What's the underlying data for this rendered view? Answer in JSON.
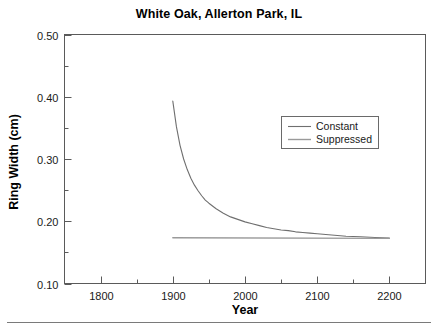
{
  "chart_data": {
    "type": "line",
    "title": "White Oak, Allerton Park, IL",
    "xlabel": "Year",
    "ylabel": "Ring Width (cm)",
    "xlim": [
      1750,
      2250
    ],
    "ylim": [
      0.1,
      0.5
    ],
    "grid": false,
    "legend_position": "upper-right-inside",
    "xticks": [
      1800,
      1900,
      2000,
      2100,
      2200
    ],
    "xtick_labels": [
      "1800",
      "1900",
      "2000",
      "2100",
      "2200"
    ],
    "xminor_ticks": [
      1750,
      1850,
      1950,
      2050,
      2150,
      2250
    ],
    "yticks": [
      0.1,
      0.2,
      0.3,
      0.4,
      0.5
    ],
    "ytick_labels": [
      "0.10",
      "0.20",
      "0.30",
      "0.40",
      "0.50"
    ],
    "yminor_ticks": [
      0.15,
      0.25,
      0.35,
      0.45
    ],
    "series": [
      {
        "name": "Constant",
        "color": "#6f6f6f",
        "x": [
          1900,
          1905,
          1910,
          1915,
          1920,
          1925,
          1930,
          1935,
          1940,
          1945,
          1950,
          1960,
          1970,
          1980,
          1990,
          2000,
          2010,
          2020,
          2030,
          2040,
          2050,
          2060,
          2070,
          2080,
          2090,
          2100,
          2120,
          2140,
          2160,
          2180,
          2200
        ],
        "y": [
          0.393,
          0.352,
          0.322,
          0.3,
          0.283,
          0.269,
          0.258,
          0.249,
          0.241,
          0.234,
          0.229,
          0.22,
          0.213,
          0.207,
          0.203,
          0.199,
          0.196,
          0.193,
          0.19,
          0.188,
          0.186,
          0.185,
          0.183,
          0.182,
          0.181,
          0.18,
          0.178,
          0.176,
          0.175,
          0.174,
          0.173
        ]
      },
      {
        "name": "Suppressed",
        "color": "#9a9a9a",
        "x": [
          1900,
          2200
        ],
        "y": [
          0.1735,
          0.1725
        ]
      }
    ]
  },
  "legend": {
    "entries": [
      {
        "label": "Constant"
      },
      {
        "label": "Suppressed"
      }
    ]
  },
  "colors": {
    "axis": "#5a5a5a",
    "text": "#1a1a1a",
    "constant_line": "#6f6f6f",
    "suppressed_line": "#9a9a9a",
    "footer_rule": "#7a7a7a"
  }
}
